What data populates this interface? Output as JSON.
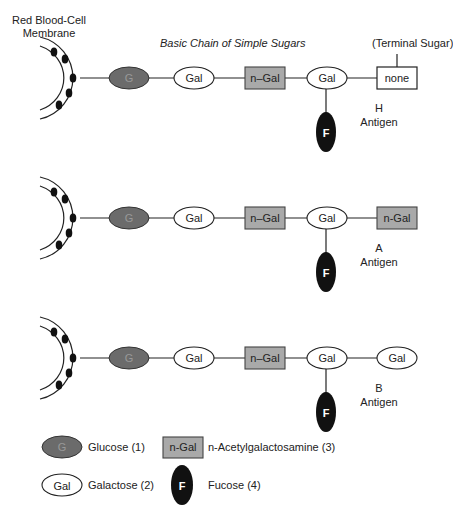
{
  "header": {
    "membrane_label_line1": "Red Blood-Cell",
    "membrane_label_line2": "Membrane",
    "chain_title": "Basic Chain of Simple Sugars",
    "terminal_label": "(Terminal Sugar)"
  },
  "rows": [
    {
      "nodes": [
        "G",
        "Gal",
        "n–Gal",
        "Gal"
      ],
      "branch": "F",
      "terminal": {
        "shape": "box-white",
        "label": "none"
      },
      "antigen_letter": "H",
      "antigen_word": "Antigen"
    },
    {
      "nodes": [
        "G",
        "Gal",
        "n–Gal",
        "Gal"
      ],
      "branch": "F",
      "terminal": {
        "shape": "box-gray",
        "label": "n-Gal"
      },
      "antigen_letter": "A",
      "antigen_word": "Antigen"
    },
    {
      "nodes": [
        "G",
        "Gal",
        "n–Gal",
        "Gal"
      ],
      "branch": "F",
      "terminal": {
        "shape": "ellipse-white",
        "label": "Gal"
      },
      "antigen_letter": "B",
      "antigen_word": "Antigen"
    }
  ],
  "legend": [
    {
      "symbol": "G",
      "shape": "ellipse-dark",
      "label": "Glucose (1)"
    },
    {
      "symbol": "n-Gal",
      "shape": "box-gray",
      "label": "n-Acetylgalactosamine (3)"
    },
    {
      "symbol": "Gal",
      "shape": "ellipse-white",
      "label": "Galactose (2)"
    },
    {
      "symbol": "F",
      "shape": "ellipse-black",
      "label": "Fucose (4)"
    }
  ],
  "colors": {
    "glucose": "#6b6b6b",
    "ngal": "#a9a9a9",
    "fucose": "#111111",
    "line": "#222222"
  }
}
